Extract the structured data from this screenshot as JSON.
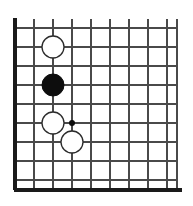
{
  "diagram": {
    "board_type": "go-board",
    "corner": "left",
    "background_color": "#ffffff",
    "grid_color": "#4a4a4a",
    "edge_color": "#1a1a1a",
    "stone_white_fill": "#ffffff",
    "stone_white_stroke": "#2b2b2b",
    "stone_black_fill": "#0d0d0d"
  },
  "geometry": {
    "width": 193,
    "height": 206,
    "cell_size": 19,
    "origin_x": 15,
    "origin_y": 9,
    "left_edge_x": 15,
    "bottom_edge_y": 190,
    "right_extent_x": 177,
    "top_extent_y": 28,
    "vertical_lines_x": [
      15,
      34,
      53,
      72,
      91,
      110,
      129,
      148,
      167,
      177
    ],
    "horizontal_lines_y": [
      28,
      47,
      66,
      85,
      104,
      123,
      142,
      161,
      180,
      190
    ],
    "stone_radius": 11,
    "hoshi_radius": 3
  },
  "stones": [
    {
      "id": "stone-1",
      "color": "white",
      "cx": 53,
      "cy": 47,
      "r": 11,
      "label": "white-stone-upper"
    },
    {
      "id": "stone-2",
      "color": "black",
      "cx": 53,
      "cy": 85,
      "r": 11,
      "label": "black-stone-middle"
    },
    {
      "id": "stone-3",
      "color": "white",
      "cx": 53,
      "cy": 123,
      "r": 11,
      "label": "white-stone-lower-left"
    },
    {
      "id": "stone-4",
      "color": "white",
      "cx": 72,
      "cy": 142,
      "r": 11,
      "label": "white-stone-lower-right"
    }
  ],
  "star_points": [
    {
      "id": "hoshi-1",
      "cx": 72,
      "cy": 123,
      "r": 3,
      "label": "star-point"
    }
  ],
  "chart_data": {
    "type": "table",
    "categories": [
      "white-stone-upper",
      "black-stone-middle",
      "white-stone-lower-left",
      "white-stone-lower-right",
      "star-point"
    ],
    "values": [
      {
        "color": "white",
        "x": 53,
        "y": 47
      },
      {
        "color": "black",
        "x": 53,
        "y": 85
      },
      {
        "color": "white",
        "x": 53,
        "y": 123
      },
      {
        "color": "white",
        "x": 72,
        "y": 142
      },
      {
        "color": "marker",
        "x": 72,
        "y": 123
      }
    ],
    "xlabel": "",
    "ylabel": ""
  }
}
